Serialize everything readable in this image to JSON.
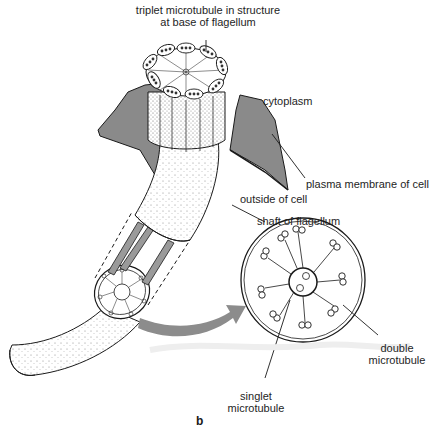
{
  "figure": {
    "panel_label": "b",
    "labels": {
      "triplet_line1": "triplet microtubule in structure",
      "triplet_line2": "at base of flagellum",
      "cytoplasm": "cytoplasm",
      "plasma_membrane": "plasma membrane of cell",
      "outside_cell": "outside of cell",
      "shaft": "shaft of flagellum",
      "double_line1": "double",
      "double_line2": "microtubule",
      "singlet_line1": "singlet",
      "singlet_line2": "microtubule"
    },
    "colors": {
      "membrane": "#8a8a8a",
      "arrow": "#8c8c8c",
      "outline": "#1a1a1a",
      "background": "#ffffff"
    }
  }
}
